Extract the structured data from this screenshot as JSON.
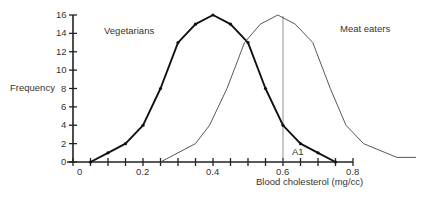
{
  "chart_data": {
    "type": "line",
    "title": "",
    "xlabel": "Blood cholesterol (mg/cc)",
    "ylabel": "Frequency",
    "xlim": [
      0,
      0.8
    ],
    "ylim": [
      0,
      16
    ],
    "x_ticks": [
      "0",
      "0.2",
      "0.4",
      "0.6",
      "0.8"
    ],
    "y_ticks": [
      "0",
      "2",
      "4",
      "6",
      "8",
      "10",
      "12",
      "14",
      "16"
    ],
    "x_minor_step": 0.05,
    "grid": false,
    "legend": "inline labels",
    "series": [
      {
        "name": "Vegetarians",
        "style": "bold line with point markers",
        "x": [
          0.05,
          0.1,
          0.15,
          0.2,
          0.25,
          0.3,
          0.35,
          0.4,
          0.45,
          0.5,
          0.55,
          0.6,
          0.65,
          0.7,
          0.75
        ],
        "y": [
          0,
          1,
          2,
          4,
          8,
          13,
          15,
          16,
          15,
          13,
          8,
          4,
          2,
          1,
          0
        ]
      },
      {
        "name": "Meat eaters",
        "style": "thin line",
        "x": [
          0.25,
          0.3,
          0.35,
          0.39,
          0.44,
          0.49,
          0.535,
          0.585,
          0.635,
          0.685,
          0.735,
          0.78,
          0.83,
          0.925,
          0.98
        ],
        "y": [
          0,
          1,
          2,
          4,
          8,
          13,
          15,
          16,
          15,
          13,
          8,
          4,
          2,
          0.5,
          0.5
        ]
      }
    ],
    "annotations": [
      {
        "text": "A1",
        "x": 0.6,
        "note": "vertical reference line at x = 0.6"
      }
    ]
  },
  "labels": {
    "vegetarians": "Vegetarians",
    "meat_eaters": "Meat eaters",
    "frequency": "Frequency",
    "xlabel": "Blood cholesterol (mg/cc)",
    "a1": "A1"
  }
}
